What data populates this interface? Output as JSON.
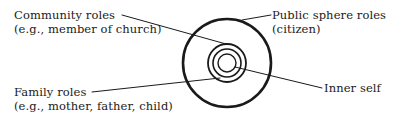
{
  "diagram": {
    "type": "concentric-circles",
    "center": [
      227,
      63
    ],
    "circles": [
      {
        "name": "public-sphere-circle",
        "r": 44,
        "stroke_width": 2.6
      },
      {
        "name": "community-circle",
        "r": 19,
        "stroke_width": 1.8
      },
      {
        "name": "family-circle",
        "r": 14,
        "stroke_width": 1.6
      },
      {
        "name": "inner-self-circle",
        "r": 9,
        "stroke_width": 1.4
      }
    ],
    "stroke_color": "#1a1a1a",
    "labels": {
      "community": {
        "title": "Community roles",
        "example": "(e.g., member of church)"
      },
      "public_sphere": {
        "title": "Public sphere roles",
        "example": "(citizen)"
      },
      "family": {
        "title": "Family roles",
        "example": "(e.g., mother, father, child)"
      },
      "inner_self": {
        "title": "Inner self"
      }
    }
  }
}
